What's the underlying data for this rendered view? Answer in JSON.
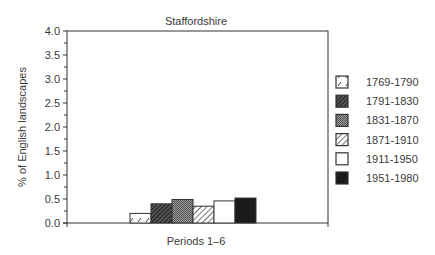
{
  "chart_data": {
    "type": "bar",
    "title": "Staffordshire",
    "xlabel": "Periods 1–6",
    "ylabel": "% of English landscapes",
    "ylim": [
      0,
      4.0
    ],
    "yticks": [
      "0.0",
      "0.5",
      "1.0",
      "1.5",
      "2.0",
      "2.5",
      "3.0",
      "3.5",
      "4.0"
    ],
    "grid": false,
    "legend_position": "right",
    "categories": [
      "1769-1790",
      "1791-1830",
      "1831-1870",
      "1871-1910",
      "1911-1950",
      "1951-1980"
    ],
    "values": [
      0.2,
      0.4,
      0.49,
      0.35,
      0.46,
      0.52
    ],
    "series": [
      {
        "name": "1769-1790",
        "value": 0.2,
        "pattern": "sparse-dash"
      },
      {
        "name": "1791-1830",
        "value": 0.4,
        "pattern": "dense-diagonal"
      },
      {
        "name": "1831-1870",
        "value": 0.49,
        "pattern": "crosshatch-grey"
      },
      {
        "name": "1871-1910",
        "value": 0.35,
        "pattern": "light-diagonal"
      },
      {
        "name": "1911-1950",
        "value": 0.46,
        "pattern": "white"
      },
      {
        "name": "1951-1980",
        "value": 0.52,
        "pattern": "solid-black"
      }
    ]
  }
}
